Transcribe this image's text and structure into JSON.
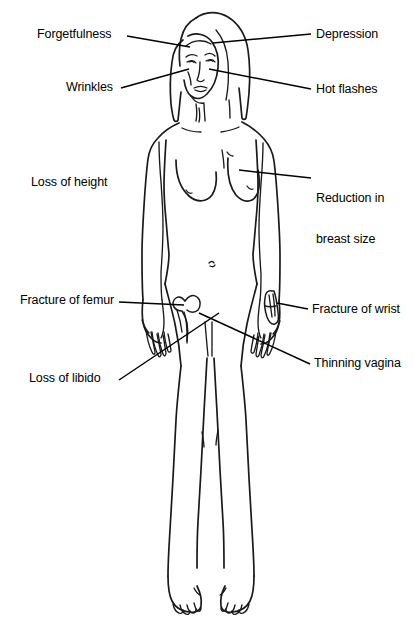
{
  "figure": {
    "view": "anterior-full-body",
    "ink_color": "#1a1a1a",
    "background_color": "#ffffff",
    "leader_line_color": "#000000"
  },
  "labels": [
    {
      "id": "forgetfulness",
      "text": "Forgetfulness",
      "side": "left",
      "x": 37,
      "y": 28,
      "target": "head-brain",
      "leader": {
        "x1": 127,
        "y1": 36,
        "x2": 190,
        "y2": 47
      }
    },
    {
      "id": "depression",
      "text": "Depression",
      "side": "right",
      "x": 316,
      "y": 28,
      "target": "head-mood",
      "leader": {
        "x1": 311,
        "y1": 34,
        "x2": 213,
        "y2": 43
      }
    },
    {
      "id": "wrinkles",
      "text": "Wrinkles",
      "side": "left",
      "x": 66,
      "y": 81,
      "target": "face-skin",
      "leader": {
        "x1": 121,
        "y1": 88,
        "x2": 189,
        "y2": 69
      }
    },
    {
      "id": "hot-flashes",
      "text": "Hot flashes",
      "side": "right",
      "x": 316,
      "y": 83,
      "target": "face-neck",
      "leader": {
        "x1": 311,
        "y1": 89,
        "x2": 209,
        "y2": 69
      }
    },
    {
      "id": "loss-of-height",
      "text": "Loss of height",
      "side": "left",
      "x": 31,
      "y": 176,
      "target": "spine",
      "leader": null
    },
    {
      "id": "reduction-in-breast-size",
      "text": "Reduction in\nbreast size",
      "line1": "Reduction in",
      "line2": "breast size",
      "side": "right",
      "x": 316,
      "y": 165,
      "target": "breast",
      "leader": {
        "x1": 311,
        "y1": 178,
        "x2": 239,
        "y2": 170
      }
    },
    {
      "id": "fracture-of-femur",
      "text": "Fracture of femur",
      "side": "left",
      "x": 20,
      "y": 294,
      "target": "femur-bone",
      "leader": {
        "x1": 119,
        "y1": 302,
        "x2": 184,
        "y2": 305
      }
    },
    {
      "id": "fracture-of-wrist",
      "text": "Fracture of wrist",
      "side": "right",
      "x": 312,
      "y": 303,
      "target": "wrist-bone",
      "leader": {
        "x1": 308,
        "y1": 309,
        "x2": 277,
        "y2": 303
      }
    },
    {
      "id": "loss-of-libido",
      "text": "Loss of libido",
      "side": "left",
      "x": 29,
      "y": 372,
      "target": "pelvis-crossing",
      "leader": {
        "x1": 119,
        "y1": 380,
        "x2": 208,
        "y2": 320
      }
    },
    {
      "id": "thinning-vagina",
      "text": "Thinning vagina",
      "side": "right",
      "x": 314,
      "y": 357,
      "target": "pelvis-crossing",
      "leader": {
        "x1": 310,
        "y1": 364,
        "x2": 208,
        "y2": 320
      }
    }
  ],
  "anatomy_parts": [
    "hair",
    "face",
    "eyes",
    "nose",
    "mouth",
    "neck",
    "shoulders",
    "breasts",
    "navel",
    "arms",
    "hands",
    "hips",
    "legs",
    "knees",
    "feet",
    "femur-bone-inset",
    "wrist-bone-inset"
  ]
}
